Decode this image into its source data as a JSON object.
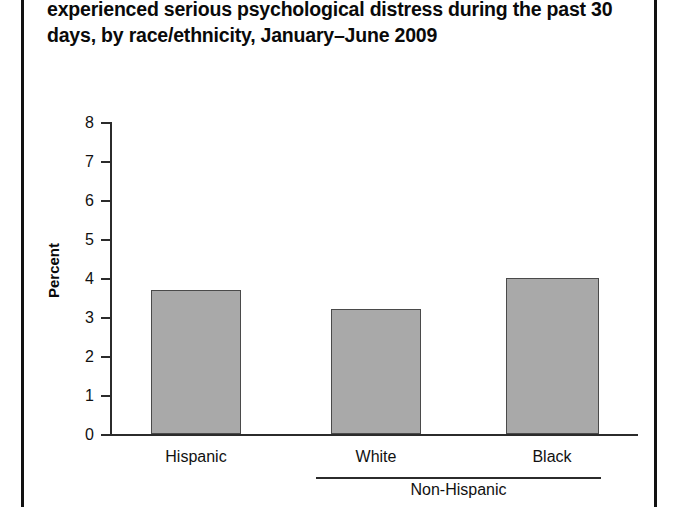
{
  "figure": {
    "title_lines": [
      "experienced serious psychological distress during the past 30",
      "days, by race/ethnicity, January–June 2009"
    ]
  },
  "colors": {
    "bar_fill": "#a9a9a9",
    "bar_border": "#4a4a4a",
    "axis": "#2b2b2b",
    "text": "#111111",
    "frame_rule": "#111111",
    "background": "#ffffff"
  },
  "chart_data": {
    "type": "bar",
    "title": "experienced serious psychological distress during the past 30 days, by race/ethnicity, January–June 2009",
    "xlabel": "",
    "ylabel": "Percent",
    "categories": [
      "Hispanic",
      "White",
      "Black"
    ],
    "values": [
      3.7,
      3.2,
      4.0
    ],
    "ylim": [
      0,
      8
    ],
    "ytick_labels": [
      "8",
      "7",
      "6",
      "5",
      "4",
      "3",
      "2",
      "1",
      "0"
    ],
    "ytick_values": [
      8,
      7,
      6,
      5,
      4,
      3,
      2,
      1,
      0
    ],
    "grid": false,
    "legend": null,
    "group_bracket": {
      "label": "Non-Hispanic",
      "covers": [
        "White",
        "Black"
      ]
    }
  }
}
